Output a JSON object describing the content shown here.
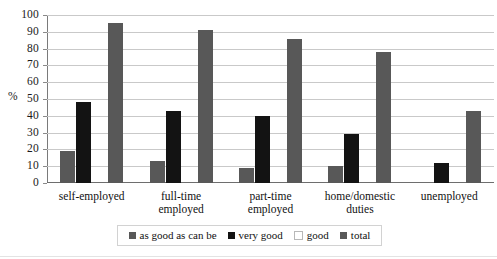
{
  "chart_data": {
    "type": "bar",
    "title": "",
    "xlabel": "",
    "ylabel": "%",
    "ylim": [
      0,
      100
    ],
    "ystep": 10,
    "grid": true,
    "legend_position": "bottom",
    "categories": [
      "self-employed",
      "full-time employed",
      "part-time employed",
      "home/domestic duties",
      "unemployed"
    ],
    "category_lines": [
      [
        "self-employed"
      ],
      [
        "full-time",
        "employed"
      ],
      [
        "part-time",
        "employed"
      ],
      [
        "home/domestic",
        "duties"
      ],
      [
        "unemployed"
      ]
    ],
    "series": [
      {
        "name": "as good as can be",
        "color": "#585858",
        "values": [
          19,
          13,
          9,
          10,
          null
        ]
      },
      {
        "name": "very good",
        "color": "#131313",
        "values": [
          48,
          43,
          40,
          29,
          12
        ]
      },
      {
        "name": "good",
        "color": "#ffffff",
        "values": [
          null,
          null,
          null,
          null,
          null
        ]
      },
      {
        "name": "total",
        "color": "#585858",
        "values": [
          95,
          91,
          86,
          78,
          43
        ]
      }
    ],
    "ytick_labels": [
      "0",
      "10",
      "20",
      "30",
      "40",
      "50",
      "60",
      "70",
      "80",
      "90",
      "100"
    ]
  },
  "legend": {
    "items": [
      {
        "label": "as good as can be"
      },
      {
        "label": "very good"
      },
      {
        "label": "good"
      },
      {
        "label": "total"
      }
    ]
  }
}
